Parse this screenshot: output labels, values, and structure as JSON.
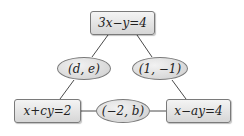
{
  "diagram": {
    "type": "triangle-of-linear-equations",
    "nodes": {
      "top": {
        "label": "3x−y=4",
        "shape": "rectangle"
      },
      "bottom_left": {
        "label": "x+cy=2",
        "shape": "rectangle"
      },
      "bottom_right": {
        "label": "x−ay=4",
        "shape": "rectangle"
      }
    },
    "edges": {
      "left": {
        "label": "(d, e)",
        "shape": "ellipse",
        "connects": [
          "top",
          "bottom_left"
        ]
      },
      "right": {
        "label": "(1, −1)",
        "shape": "ellipse",
        "connects": [
          "top",
          "bottom_right"
        ]
      },
      "bottom": {
        "label": "(−2, b)",
        "shape": "ellipse",
        "connects": [
          "bottom_left",
          "bottom_right"
        ]
      }
    },
    "colors": {
      "line": "#4a4a4a",
      "border": "#7a7a7a",
      "fill_light": "#f4f4f4",
      "fill_dark": "#d6d6d6",
      "text": "#222222"
    }
  }
}
